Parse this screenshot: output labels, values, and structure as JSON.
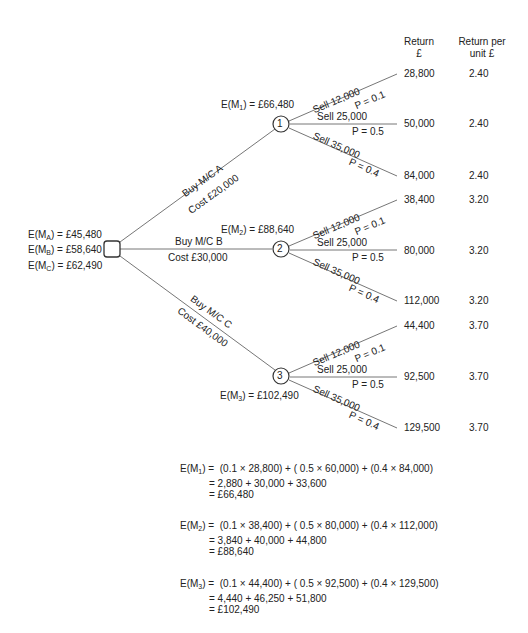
{
  "headers": {
    "return": [
      "Return",
      "£"
    ],
    "return_per_unit": [
      "Return per",
      "unit £"
    ]
  },
  "decision_node": {
    "labels": [
      {
        "sub": "A",
        "value": "£45,480"
      },
      {
        "sub": "B",
        "value": "£58,640"
      },
      {
        "sub": "C",
        "value": "£62,490"
      }
    ]
  },
  "options": [
    {
      "buy": "Buy M/C A",
      "cost": "Cost £20,000",
      "node": "1",
      "ev_sub": "1",
      "ev_value": "£66,480",
      "outcomes": [
        {
          "sell": "Sell 12,000",
          "p": "P = 0.1",
          "return": "28,800",
          "per_unit": "2.40"
        },
        {
          "sell": "Sell 25,000",
          "p": "P = 0.5",
          "return": "50,000",
          "per_unit": "2.40"
        },
        {
          "sell": "Sell 35,000",
          "p": "P = 0.4",
          "return": "84,000",
          "per_unit": "2.40"
        }
      ]
    },
    {
      "buy": "Buy M/C B",
      "cost": "Cost £30,000",
      "node": "2",
      "ev_sub": "2",
      "ev_value": "£88,640",
      "outcomes": [
        {
          "sell": "Sell 12,000",
          "p": "P = 0.1",
          "return": "38,400",
          "per_unit": "3.20"
        },
        {
          "sell": "Sell 25,000",
          "p": "P = 0.5",
          "return": "80,000",
          "per_unit": "3.20"
        },
        {
          "sell": "Sell 35,000",
          "p": "P = 0.4",
          "return": "112,000",
          "per_unit": "3.20"
        }
      ]
    },
    {
      "buy": "Buy M/C C",
      "cost": "Cost £40,000",
      "node": "3",
      "ev_sub": "3",
      "ev_value": "£102,490",
      "outcomes": [
        {
          "sell": "Sell 12,000",
          "p": "P = 0.1",
          "return": "44,400",
          "per_unit": "3.70"
        },
        {
          "sell": "Sell 25,000",
          "p": "P = 0.5",
          "return": "92,500",
          "per_unit": "3.70"
        },
        {
          "sell": "Sell 35,000",
          "p": "P = 0.4",
          "return": "129,500",
          "per_unit": "3.70"
        }
      ]
    }
  ],
  "calculations": [
    {
      "sub": "1",
      "line1": "(0.1 × 28,800) + ( 0.5 × 60,000) + (0.4 × 84,000)",
      "line2": "= 2,880 + 30,000 + 33,600",
      "line3": "= £66,480"
    },
    {
      "sub": "2",
      "line1": "(0.1 × 38,400) + ( 0.5 × 80,000) + (0.4 × 112,000)",
      "line2": "= 3,840 + 40,000 + 44,800",
      "line3": "= £88,640"
    },
    {
      "sub": "3",
      "line1": "(0.1 × 44,400) + ( 0.5 × 92,500) + (0.4 × 129,500)",
      "line2": "= 4,440 + 46,250 + 51,800",
      "line3": "= £102,490"
    }
  ],
  "text": {
    "E": "E(M",
    "close_eq": ") = ",
    "close_eq_calc": ") = "
  }
}
